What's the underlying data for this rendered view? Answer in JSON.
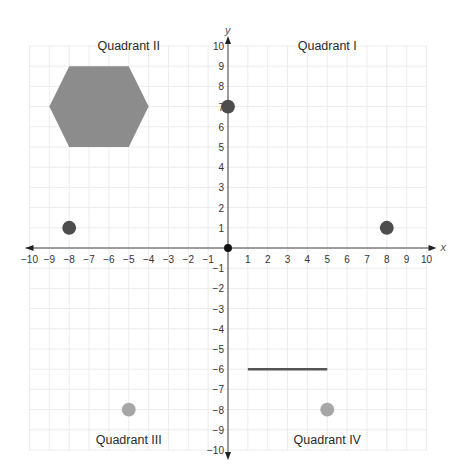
{
  "chart_data": {
    "type": "scatter",
    "title": "",
    "xlabel": "x",
    "ylabel": "y",
    "xlim": [
      -10,
      10
    ],
    "ylim": [
      -10,
      10
    ],
    "grid": true,
    "x_ticks": [
      -10,
      -9,
      -8,
      -7,
      -6,
      -5,
      -4,
      -3,
      -2,
      -1,
      1,
      2,
      3,
      4,
      5,
      6,
      7,
      8,
      9,
      10
    ],
    "y_ticks": [
      -10,
      -9,
      -8,
      -7,
      -6,
      -5,
      -4,
      -3,
      -2,
      -1,
      1,
      2,
      3,
      4,
      5,
      6,
      7,
      8,
      9,
      10
    ],
    "quadrant_labels": [
      {
        "text": "Quadrant I",
        "x": 5,
        "y": 9.8
      },
      {
        "text": "Quadrant II",
        "x": -5,
        "y": 9.8
      },
      {
        "text": "Quadrant III",
        "x": -5,
        "y": -9.7
      },
      {
        "text": "Quadrant IV",
        "x": 5,
        "y": -9.7
      }
    ],
    "points": [
      {
        "x": 0,
        "y": 0,
        "color": "#111111",
        "r": 0.2,
        "label": "origin"
      },
      {
        "x": 0,
        "y": 7,
        "color": "#4d4d4d",
        "r": 0.35
      },
      {
        "x": -8,
        "y": 1,
        "color": "#4d4d4d",
        "r": 0.35
      },
      {
        "x": 8,
        "y": 1,
        "color": "#4d4d4d",
        "r": 0.35
      },
      {
        "x": -5,
        "y": -8,
        "color": "#a6a6a6",
        "r": 0.35
      },
      {
        "x": 5,
        "y": -8,
        "color": "#a6a6a6",
        "r": 0.35
      }
    ],
    "segments": [
      {
        "x1": 1,
        "y1": -6,
        "x2": 5,
        "y2": -6,
        "color": "#555555"
      }
    ],
    "polygons": [
      {
        "name": "hexagon",
        "color": "#8c8c8c",
        "vertices": [
          [
            -8,
            9
          ],
          [
            -5,
            9
          ],
          [
            -4,
            7
          ],
          [
            -5,
            5
          ],
          [
            -8,
            5
          ],
          [
            -9,
            7
          ]
        ]
      }
    ]
  },
  "colors": {
    "axis": "#444444",
    "grid": "#ececec",
    "dark_point": "#4d4d4d",
    "light_point": "#a6a6a6",
    "hexagon": "#8c8c8c",
    "segment": "#555555"
  }
}
